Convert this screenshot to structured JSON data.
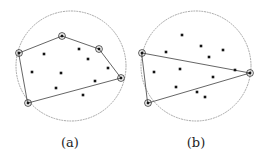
{
  "figure": {
    "width": 264,
    "height": 155,
    "background_color": "#ffffff",
    "colors": {
      "point_fill": "#141414",
      "hull_edge": "#4a4a4a",
      "circle_stroke": "#8f8f8f",
      "vertex_ring": "#2b2b2b",
      "caption": "#232323"
    },
    "style": {
      "circle_dash": "dotted",
      "point_marker": "square",
      "hull_vertex_marker": "square-with-ring",
      "point_square_size": 2.6,
      "hull_vertex_square_size": 2.6,
      "hull_vertex_ring_radius": 3.4,
      "hull_edge_width": 0.85,
      "circle_stroke_width": 0.8
    }
  },
  "panels": [
    {
      "id": "panel-a",
      "caption": "(a)",
      "caption_pos": {
        "x": 70,
        "y": 147
      },
      "circle": {
        "cx": 71,
        "cy": 66,
        "r": 55
      },
      "hull_vertex_count": 5,
      "hull_vertices": [
        {
          "name": "left",
          "x": 19,
          "y": 53
        },
        {
          "name": "top",
          "x": 62,
          "y": 36
        },
        {
          "name": "upper-right",
          "x": 99,
          "y": 49
        },
        {
          "name": "right",
          "x": 121,
          "y": 78
        },
        {
          "name": "bottom-left",
          "x": 28,
          "y": 103
        }
      ],
      "hull_path": "M 19 53 L 62 36 L 99 49 L 121 78 L 28 103 Z",
      "interior_points": [
        {
          "x": 44,
          "y": 54
        },
        {
          "x": 79,
          "y": 49
        },
        {
          "x": 88,
          "y": 59
        },
        {
          "x": 32,
          "y": 72
        },
        {
          "x": 61,
          "y": 73
        },
        {
          "x": 108,
          "y": 68
        },
        {
          "x": 56,
          "y": 88
        },
        {
          "x": 95,
          "y": 81
        },
        {
          "x": 83,
          "y": 95
        }
      ],
      "interior_point_count": 9
    },
    {
      "id": "panel-b",
      "caption": "(b)",
      "caption_pos": {
        "x": 196,
        "y": 147
      },
      "circle": {
        "cx": 196,
        "cy": 66,
        "r": 55
      },
      "hull_vertex_count": 3,
      "hull_vertices": [
        {
          "name": "left",
          "x": 142,
          "y": 53
        },
        {
          "name": "right",
          "x": 250,
          "y": 73
        },
        {
          "name": "bottom-left",
          "x": 148,
          "y": 103
        }
      ],
      "hull_path": "M 142 53 L 250 73 L 148 103 Z",
      "interior_points": [
        {
          "x": 182,
          "y": 35
        },
        {
          "x": 166,
          "y": 52
        },
        {
          "x": 201,
          "y": 46
        },
        {
          "x": 223,
          "y": 50
        },
        {
          "x": 209,
          "y": 57
        },
        {
          "x": 154,
          "y": 72
        },
        {
          "x": 180,
          "y": 69
        },
        {
          "x": 235,
          "y": 70
        },
        {
          "x": 213,
          "y": 77
        },
        {
          "x": 176,
          "y": 87
        },
        {
          "x": 197,
          "y": 92
        },
        {
          "x": 205,
          "y": 97
        }
      ],
      "interior_point_count": 12
    }
  ]
}
